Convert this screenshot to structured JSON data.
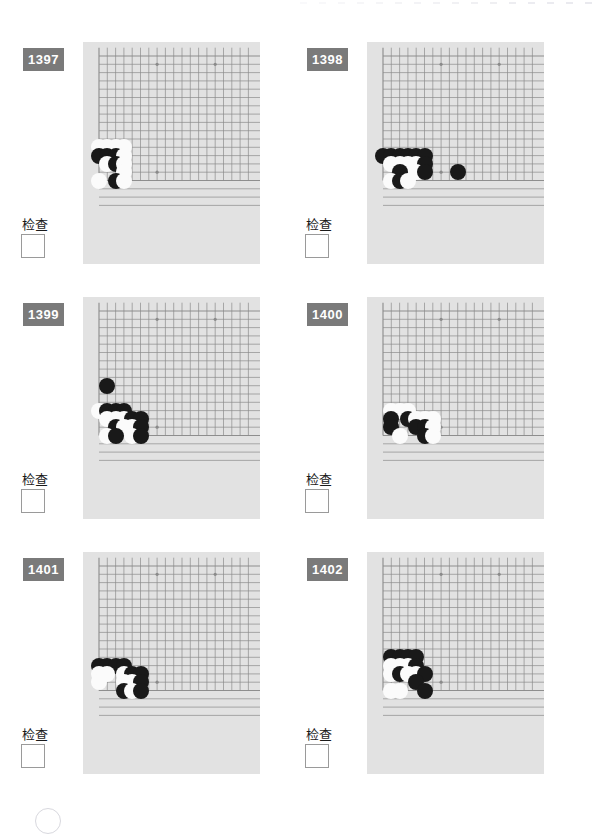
{
  "page": {
    "background": "#ffffff",
    "board_color": "#e2e2e2",
    "grid_color": "#8a8a8a",
    "badge_color": "#7a7a7a",
    "black_color": "#191919",
    "white_color": "#fbfbfb",
    "check_label": "检查",
    "top_tick_count": 16
  },
  "layout": {
    "board_cell": 8.3,
    "stone_diameter": 16,
    "grid_cols": 19,
    "grid_rows": 19
  },
  "puzzles": [
    {
      "id": "1397",
      "number": "1397",
      "check_label": "检查",
      "checked": false,
      "board": {
        "x": 83,
        "y": 42,
        "w": 177,
        "h": 222
      },
      "origin": {
        "x": 99,
        "y": 56
      },
      "star_points": [
        [
          7,
          1
        ],
        [
          14,
          1
        ],
        [
          7,
          14
        ]
      ],
      "stones": [
        {
          "c": "w",
          "col": 0,
          "row": 11
        },
        {
          "c": "w",
          "col": 1,
          "row": 11
        },
        {
          "c": "w",
          "col": 2,
          "row": 11
        },
        {
          "c": "w",
          "col": 3,
          "row": 11
        },
        {
          "c": "b",
          "col": 0,
          "row": 12
        },
        {
          "c": "b",
          "col": 1,
          "row": 12
        },
        {
          "c": "b",
          "col": 2,
          "row": 12
        },
        {
          "c": "w",
          "col": 3,
          "row": 12
        },
        {
          "c": "w",
          "col": 1,
          "row": 13
        },
        {
          "c": "b",
          "col": 2,
          "row": 13
        },
        {
          "c": "w",
          "col": 3,
          "row": 13
        },
        {
          "c": "w",
          "col": 3,
          "row": 14
        },
        {
          "c": "w",
          "col": 0,
          "row": 15
        },
        {
          "c": "b",
          "col": 2,
          "row": 15
        },
        {
          "c": "w",
          "col": 3,
          "row": 15
        }
      ]
    },
    {
      "id": "1398",
      "number": "1398",
      "check_label": "检查",
      "checked": false,
      "board": {
        "x": 367,
        "y": 42,
        "w": 177,
        "h": 222
      },
      "origin": {
        "x": 383,
        "y": 56
      },
      "star_points": [
        [
          7,
          1
        ],
        [
          14,
          1
        ],
        [
          7,
          14
        ]
      ],
      "stones": [
        {
          "c": "b",
          "col": 0,
          "row": 12
        },
        {
          "c": "b",
          "col": 1,
          "row": 12
        },
        {
          "c": "b",
          "col": 2,
          "row": 12
        },
        {
          "c": "b",
          "col": 3,
          "row": 12
        },
        {
          "c": "b",
          "col": 4,
          "row": 12
        },
        {
          "c": "b",
          "col": 5,
          "row": 12
        },
        {
          "c": "w",
          "col": 1,
          "row": 13
        },
        {
          "c": "w",
          "col": 2,
          "row": 13
        },
        {
          "c": "w",
          "col": 3,
          "row": 13
        },
        {
          "c": "w",
          "col": 4,
          "row": 13
        },
        {
          "c": "b",
          "col": 5,
          "row": 13
        },
        {
          "c": "b",
          "col": 2,
          "row": 14
        },
        {
          "c": "w",
          "col": 4,
          "row": 14
        },
        {
          "c": "b",
          "col": 5,
          "row": 14
        },
        {
          "c": "b",
          "col": 9,
          "row": 14
        },
        {
          "c": "w",
          "col": 1,
          "row": 15
        },
        {
          "c": "b",
          "col": 2,
          "row": 15
        },
        {
          "c": "w",
          "col": 3,
          "row": 15
        }
      ]
    },
    {
      "id": "1399",
      "number": "1399",
      "check_label": "检查",
      "checked": false,
      "board": {
        "x": 83,
        "y": 297,
        "w": 177,
        "h": 222
      },
      "origin": {
        "x": 99,
        "y": 311
      },
      "star_points": [
        [
          7,
          1
        ],
        [
          14,
          1
        ],
        [
          7,
          14
        ]
      ],
      "stones": [
        {
          "c": "b",
          "col": 1,
          "row": 9
        },
        {
          "c": "w",
          "col": 0,
          "row": 12
        },
        {
          "c": "b",
          "col": 1,
          "row": 12
        },
        {
          "c": "b",
          "col": 2,
          "row": 12
        },
        {
          "c": "b",
          "col": 3,
          "row": 12
        },
        {
          "c": "w",
          "col": 1,
          "row": 13
        },
        {
          "c": "w",
          "col": 2,
          "row": 13
        },
        {
          "c": "w",
          "col": 3,
          "row": 13
        },
        {
          "c": "b",
          "col": 4,
          "row": 13
        },
        {
          "c": "b",
          "col": 5,
          "row": 13
        },
        {
          "c": "b",
          "col": 2,
          "row": 14
        },
        {
          "c": "w",
          "col": 3,
          "row": 14
        },
        {
          "c": "w",
          "col": 4,
          "row": 14
        },
        {
          "c": "b",
          "col": 5,
          "row": 14
        },
        {
          "c": "w",
          "col": 1,
          "row": 15
        },
        {
          "c": "b",
          "col": 2,
          "row": 15
        },
        {
          "c": "w",
          "col": 4,
          "row": 15
        },
        {
          "c": "b",
          "col": 5,
          "row": 15
        }
      ]
    },
    {
      "id": "1400",
      "number": "1400",
      "check_label": "检查",
      "checked": false,
      "board": {
        "x": 367,
        "y": 297,
        "w": 177,
        "h": 222
      },
      "origin": {
        "x": 383,
        "y": 311
      },
      "star_points": [
        [
          7,
          1
        ],
        [
          14,
          1
        ],
        [
          7,
          14
        ]
      ],
      "stones": [
        {
          "c": "w",
          "col": 1,
          "row": 12
        },
        {
          "c": "w",
          "col": 2,
          "row": 12
        },
        {
          "c": "w",
          "col": 3,
          "row": 12
        },
        {
          "c": "b",
          "col": 1,
          "row": 13
        },
        {
          "c": "b",
          "col": 3,
          "row": 13
        },
        {
          "c": "w",
          "col": 4,
          "row": 13
        },
        {
          "c": "w",
          "col": 5,
          "row": 13
        },
        {
          "c": "w",
          "col": 6,
          "row": 13
        },
        {
          "c": "b",
          "col": 1,
          "row": 14
        },
        {
          "c": "b",
          "col": 4,
          "row": 14
        },
        {
          "c": "b",
          "col": 5,
          "row": 14
        },
        {
          "c": "w",
          "col": 6,
          "row": 14
        },
        {
          "c": "w",
          "col": 2,
          "row": 15
        },
        {
          "c": "b",
          "col": 5,
          "row": 15
        },
        {
          "c": "w",
          "col": 6,
          "row": 15
        }
      ]
    },
    {
      "id": "1401",
      "number": "1401",
      "check_label": "检查",
      "checked": false,
      "board": {
        "x": 83,
        "y": 552,
        "w": 177,
        "h": 222
      },
      "origin": {
        "x": 99,
        "y": 566
      },
      "star_points": [
        [
          7,
          1
        ],
        [
          14,
          1
        ],
        [
          7,
          14
        ]
      ],
      "stones": [
        {
          "c": "b",
          "col": 0,
          "row": 12
        },
        {
          "c": "b",
          "col": 1,
          "row": 12
        },
        {
          "c": "b",
          "col": 2,
          "row": 12
        },
        {
          "c": "b",
          "col": 3,
          "row": 12
        },
        {
          "c": "w",
          "col": 0,
          "row": 13
        },
        {
          "c": "w",
          "col": 1,
          "row": 13
        },
        {
          "c": "w",
          "col": 3,
          "row": 13
        },
        {
          "c": "b",
          "col": 4,
          "row": 13
        },
        {
          "c": "b",
          "col": 5,
          "row": 13
        },
        {
          "c": "w",
          "col": 0,
          "row": 14
        },
        {
          "c": "w",
          "col": 3,
          "row": 14
        },
        {
          "c": "w",
          "col": 4,
          "row": 14
        },
        {
          "c": "b",
          "col": 5,
          "row": 14
        },
        {
          "c": "b",
          "col": 3,
          "row": 15
        },
        {
          "c": "w",
          "col": 4,
          "row": 15
        },
        {
          "c": "b",
          "col": 5,
          "row": 15
        }
      ]
    },
    {
      "id": "1402",
      "number": "1402",
      "check_label": "检查",
      "checked": false,
      "board": {
        "x": 367,
        "y": 552,
        "w": 177,
        "h": 222
      },
      "origin": {
        "x": 383,
        "y": 566
      },
      "star_points": [
        [
          7,
          1
        ],
        [
          14,
          1
        ],
        [
          7,
          14
        ]
      ],
      "stones": [
        {
          "c": "b",
          "col": 1,
          "row": 11
        },
        {
          "c": "b",
          "col": 2,
          "row": 11
        },
        {
          "c": "b",
          "col": 3,
          "row": 11
        },
        {
          "c": "b",
          "col": 4,
          "row": 11
        },
        {
          "c": "w",
          "col": 1,
          "row": 12
        },
        {
          "c": "w",
          "col": 2,
          "row": 12
        },
        {
          "c": "w",
          "col": 3,
          "row": 12
        },
        {
          "c": "b",
          "col": 4,
          "row": 12
        },
        {
          "c": "w",
          "col": 1,
          "row": 13
        },
        {
          "c": "b",
          "col": 2,
          "row": 13
        },
        {
          "c": "w",
          "col": 3,
          "row": 13
        },
        {
          "c": "w",
          "col": 4,
          "row": 13
        },
        {
          "c": "b",
          "col": 5,
          "row": 13
        },
        {
          "c": "b",
          "col": 4,
          "row": 14
        },
        {
          "c": "w",
          "col": 1,
          "row": 15
        },
        {
          "c": "w",
          "col": 2,
          "row": 15
        },
        {
          "c": "b",
          "col": 5,
          "row": 15
        }
      ]
    }
  ],
  "footer": {
    "arc": {
      "x": 35,
      "y": 808
    }
  }
}
